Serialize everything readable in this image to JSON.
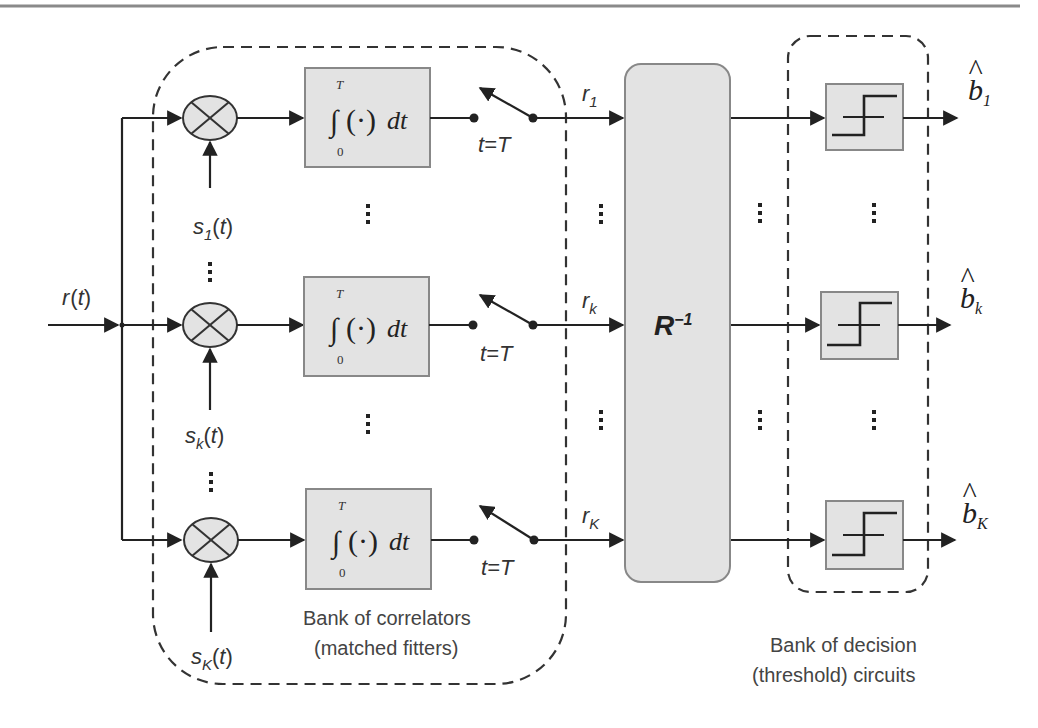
{
  "diagram": {
    "input": {
      "label": "r(t)",
      "sym": "r",
      "arg": "(t)"
    },
    "rows": [
      {
        "id": "1",
        "signal_sym": "s",
        "signal_sub": "1",
        "signal_arg": "(t)",
        "output_sym": "r",
        "output_sub": "1",
        "decision_sym": "b",
        "decision_sub": "1",
        "y": 118
      },
      {
        "id": "k",
        "signal_sym": "s",
        "signal_sub": "k",
        "signal_arg": "(t)",
        "output_sym": "r",
        "output_sub": "k",
        "decision_sym": "b",
        "decision_sub": "k",
        "y": 325
      },
      {
        "id": "K",
        "signal_sym": "s",
        "signal_sub": "K",
        "signal_arg": "(t)",
        "output_sym": "r",
        "output_sub": "K",
        "decision_sym": "b",
        "decision_sub": "K",
        "y": 540
      }
    ],
    "integrator": {
      "upper_limit": "T",
      "lower_limit": "0",
      "integrand": "(·)",
      "differential": "dt"
    },
    "switch_label": "t=T",
    "matrix_block": {
      "label": "R",
      "superscript": "−1"
    },
    "ellipsis": "⋮",
    "captions": {
      "correlators_line1": "Bank of correlators",
      "correlators_line2": "(matched fitters)",
      "decision_line1": "Bank of decision",
      "decision_line2": "(threshold) circuits"
    },
    "colors": {
      "line": "#222222",
      "block_fill": "#e3e3e3",
      "block_stroke": "#888888",
      "dashed": "#333333",
      "rule": "#8a8a8a"
    }
  }
}
